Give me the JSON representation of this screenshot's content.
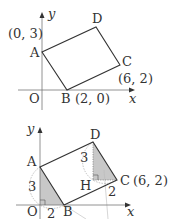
{
  "top_diagram": {
    "axis_x_label": "x",
    "axis_y_label": "y",
    "origin_label": "O",
    "vertices": {
      "A": {
        "label": "A",
        "coord_label": "(0, 3)"
      },
      "B": {
        "label": "B",
        "coord_label": "(2, 0)"
      },
      "C": {
        "label": "C",
        "coord_label": "(6, 2)"
      },
      "D": {
        "label": "D"
      }
    }
  },
  "bottom_diagram": {
    "axis_x_label": "x",
    "axis_y_label": "y",
    "origin_label": "O",
    "vertices": {
      "A": {
        "label": "A"
      },
      "B": {
        "label": "B"
      },
      "C": {
        "label": "C",
        "coord_label": "(6, 2)"
      },
      "D": {
        "label": "D"
      },
      "H": {
        "label": "H"
      }
    },
    "lengths": {
      "OA": "3",
      "OB": "2",
      "DH": "3",
      "HC": "2"
    },
    "colors": {
      "shade": "#c8c8c8",
      "line": "#333333",
      "dashed": "#888888"
    }
  }
}
